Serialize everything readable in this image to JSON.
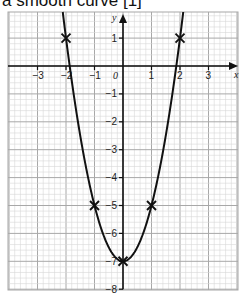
{
  "caption": "a smooth curve [1]",
  "chart_data": {
    "type": "line",
    "title": "",
    "xlabel": "x",
    "ylabel": "y",
    "xlim": [
      -3.5,
      4.5
    ],
    "ylim": [
      -8,
      1.9
    ],
    "grid": true,
    "x_ticks": [
      -3,
      -2,
      -1,
      0,
      1,
      2,
      3
    ],
    "x_tick_labels": [
      "−3",
      "−2",
      "−1",
      "0",
      "1",
      "2",
      "3"
    ],
    "y_ticks": [
      1,
      -1,
      -2,
      -3,
      -4,
      -5,
      -6,
      -7,
      -8
    ],
    "y_tick_labels": [
      "1",
      "−1",
      "−2",
      "−3",
      "−4",
      "−5",
      "−6",
      "−7",
      "−8"
    ],
    "curve": "y = 2x^2 - 7",
    "points": [
      {
        "x": -2,
        "y": 1
      },
      {
        "x": -1,
        "y": -5
      },
      {
        "x": 0,
        "y": -7
      },
      {
        "x": 1,
        "y": -5
      },
      {
        "x": 2,
        "y": 1
      }
    ],
    "marker": "x",
    "colors": {
      "curve": "#111111",
      "grid_minor": "#d6d6d6",
      "grid_major": "#a8a8a8",
      "axis": "#111111"
    }
  }
}
